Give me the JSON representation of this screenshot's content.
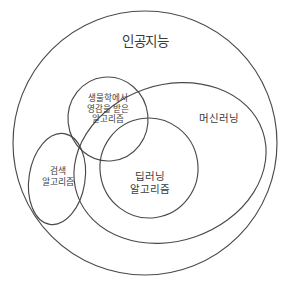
{
  "diagram": {
    "type": "venn-nested-set",
    "background_color": "#ffffff",
    "stroke_color": "#4a4a4a",
    "text_color": "#3b3b3b",
    "sets": [
      {
        "id": "ai",
        "label": "인공지능",
        "shape": "circle",
        "level": 0,
        "label_position": "top-center"
      },
      {
        "id": "machine_learning",
        "label": "머신러닝",
        "shape": "ellipse",
        "level": 1,
        "parent": "ai",
        "label_position": "right"
      },
      {
        "id": "bio_inspired",
        "label": "생물학에서\n영감을 받은\n알고리즘",
        "shape": "circle",
        "level": 1,
        "parent": "ai",
        "label_position": "upper-left"
      },
      {
        "id": "deep_learning",
        "label": "딥러닝\n알고리즘",
        "shape": "ellipse",
        "level": 2,
        "parent": "machine_learning",
        "label_position": "center"
      },
      {
        "id": "search",
        "label": "검색\n알고리즘",
        "shape": "ellipse",
        "level": 1,
        "parent": "ai",
        "label_position": "lower-left"
      }
    ]
  }
}
